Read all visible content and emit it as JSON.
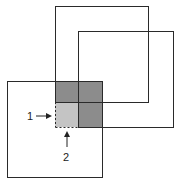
{
  "diagram": {
    "colors": {
      "outline": "#2a2a2a",
      "dark_overlap": "#8c8c8c",
      "light_overlap": "#c4c4c4",
      "background": "#ffffff"
    },
    "squares": [
      {
        "name": "top-square",
        "x": 55,
        "y": 6,
        "w": 93,
        "h": 96
      },
      {
        "name": "right-square",
        "x": 78,
        "y": 31,
        "w": 96,
        "h": 96
      },
      {
        "name": "bottom-left-square",
        "x": 7,
        "y": 81,
        "w": 95,
        "h": 96
      }
    ],
    "labels": {
      "label_1": "1",
      "label_2": "2"
    }
  }
}
